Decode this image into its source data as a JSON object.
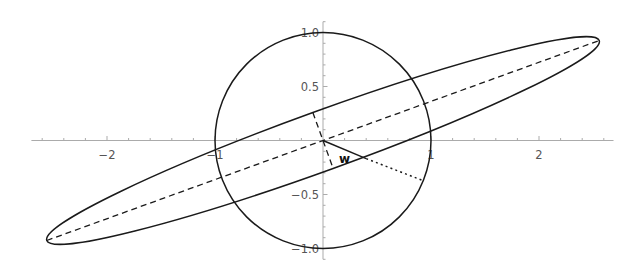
{
  "diagram": {
    "type": "parametric-plot",
    "colors": {
      "background": "#ffffff",
      "curve": "#1a1a1a",
      "axis": "#ababab",
      "tick_label": "#555555",
      "label": "#111111"
    },
    "axes": {
      "origin_px": [
        323,
        140.5
      ],
      "scale_px_per_unit": 108,
      "x_range": [
        -2.7,
        2.69
      ],
      "y_range": [
        -1.1,
        1.1
      ],
      "x_ticks": {
        "minor_step": 0.2,
        "labels": [
          {
            "value": -2,
            "text": "−2"
          },
          {
            "value": -1,
            "text": "−1"
          },
          {
            "value": 1,
            "text": "1"
          },
          {
            "value": 2,
            "text": "2"
          }
        ]
      },
      "y_ticks": {
        "minor_step": 0.1,
        "labels": [
          {
            "value": 1.0,
            "text": "1.0"
          },
          {
            "value": 0.5,
            "text": "0.5"
          },
          {
            "value": -0.5,
            "text": "−0.5"
          },
          {
            "value": -1.0,
            "text": "−1.0"
          }
        ]
      }
    },
    "circle": {
      "center": [
        0,
        0
      ],
      "radius": 1
    },
    "ellipse": {
      "center": [
        0,
        0
      ],
      "semi_major": 2.72,
      "semi_minor": 0.275,
      "angle_deg": 19.9
    },
    "major_axis": {
      "from": [
        -2.558,
        -0.926
      ],
      "to": [
        2.558,
        0.926
      ],
      "style": "dashed"
    },
    "minor_axis": {
      "from": [
        -0.094,
        0.259
      ],
      "to": [
        0.094,
        -0.259
      ],
      "style": "dashed"
    },
    "vector_w": {
      "from": [
        0,
        0
      ],
      "to": [
        0.4,
        -0.168
      ],
      "style": "solid",
      "label": "w",
      "label_pos": [
        0.2,
        -0.175
      ]
    },
    "extension": {
      "from": [
        0.4,
        -0.168
      ],
      "to": [
        0.928,
        -0.372
      ],
      "style": "dotted"
    }
  }
}
